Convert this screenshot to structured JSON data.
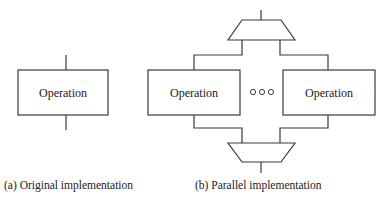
{
  "diagram": {
    "original": {
      "box_label": "Operation",
      "caption": "(a) Original implementation"
    },
    "parallel": {
      "left_box_label": "Operation",
      "right_box_label": "Operation",
      "ellipsis": "ooo",
      "caption": "(b) Parallel implementation",
      "top_block": "demultiplexer-trapezoid",
      "bottom_block": "multiplexer-trapezoid"
    },
    "colors": {
      "stroke": "#3a3a3a",
      "text": "#222222",
      "background": "#ffffff"
    }
  }
}
